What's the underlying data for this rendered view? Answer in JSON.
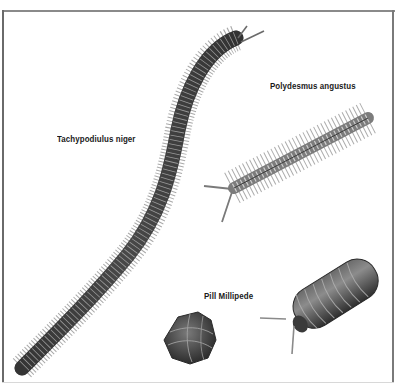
{
  "figure": {
    "labels": {
      "tachypodiulus": "Tachypodiulus niger",
      "polydesmus": "Polydesmus angustus",
      "pill": "Pill Millipede"
    },
    "colors": {
      "background": "#ffffff",
      "frame": "#7a7a7a",
      "label_text": "#1a1a1a",
      "body_dark": "#3a3a3a",
      "body_mid": "#6e6e6e",
      "segment_light": "#b8b8b8",
      "legs": "#8a8a8a"
    }
  }
}
